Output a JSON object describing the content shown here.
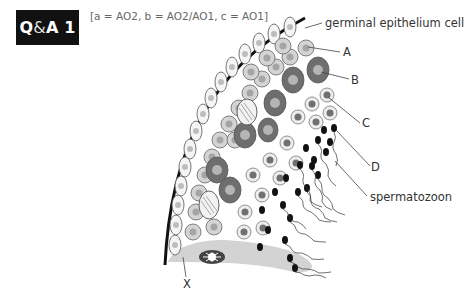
{
  "badge": {
    "prefix": "Q",
    "amp": "&",
    "suffix": "A 1"
  },
  "caption": "[a = AO2, b = AO2/AO1, c = AO1]",
  "labels": {
    "germinal": "germinal epithelium cell",
    "A": "A",
    "B": "B",
    "C": "C",
    "D": "D",
    "spermatozoon": "spermatozoon",
    "X": "X"
  },
  "colors": {
    "badge_bg": "#111111",
    "wall": "#111111",
    "light_cell": "#d4d4d4",
    "dark_cell": "#6e6e6e",
    "nucleus_light": "#a9a9a9",
    "sertoli": "#d0d0d0",
    "head": "#111111"
  }
}
